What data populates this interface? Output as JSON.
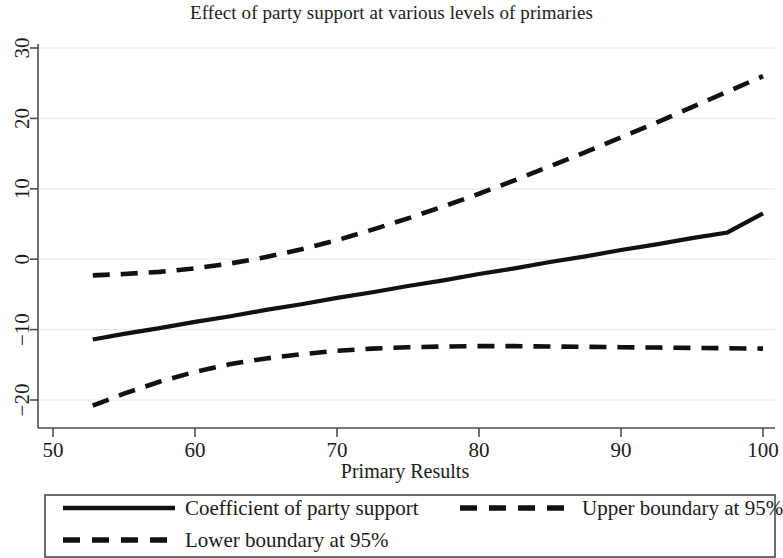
{
  "figure": {
    "title": "Effect of party support at various levels of primaries",
    "background": "#ffffff",
    "line_color": "#111111",
    "grid_color": "#e8e8e8",
    "axis_color": "#4d4d4d"
  },
  "axes": {
    "x": {
      "label": "Primary Results",
      "ticks": [
        "50",
        "60",
        "70",
        "80",
        "90",
        "100"
      ],
      "tick_values": [
        50,
        60,
        70,
        80,
        90,
        100
      ],
      "min": 50,
      "max": 100
    },
    "y": {
      "label": "",
      "ticks": [
        "30",
        "20",
        "10",
        "0",
        "-10",
        "-20"
      ],
      "tick_values": [
        30,
        20,
        10,
        0,
        -10,
        -20
      ],
      "min": -22,
      "max": 32
    }
  },
  "legend": {
    "entries": [
      {
        "label": "Coefficient of party support",
        "style": "solid"
      },
      {
        "label": "Upper boundary at 95%",
        "style": "dashed"
      },
      {
        "label": "Lower boundary at 95%",
        "style": "dashed"
      }
    ]
  },
  "chart_data": {
    "type": "line",
    "title": "Effect of party support at various levels of primaries",
    "xlabel": "Primary Results",
    "ylabel": "",
    "xlim": [
      50,
      100
    ],
    "ylim": [
      -22,
      32
    ],
    "grid": true,
    "legend_position": "below-axes",
    "x": [
      52.8,
      55,
      57.5,
      60,
      62.5,
      65,
      67.5,
      70,
      72.5,
      75,
      77.5,
      80,
      82.5,
      85,
      87.5,
      90,
      92.5,
      95,
      97.5,
      100
    ],
    "series": [
      {
        "name": "Coefficient of party support",
        "style": "solid",
        "values": [
          -11.4,
          -10.6,
          -9.8,
          -8.9,
          -8.1,
          -7.2,
          -6.4,
          -5.5,
          -4.7,
          -3.8,
          -3.0,
          -2.1,
          -1.3,
          -0.4,
          0.4,
          1.3,
          2.1,
          3.0,
          3.8,
          6.5
        ]
      },
      {
        "name": "Upper boundary at 95%",
        "style": "dashed",
        "values": [
          -2.3,
          -2.1,
          -1.8,
          -1.3,
          -0.6,
          0.3,
          1.4,
          2.7,
          4.2,
          5.8,
          7.5,
          9.3,
          11.2,
          13.2,
          15.2,
          17.3,
          19.4,
          21.6,
          23.8,
          26.0
        ]
      },
      {
        "name": "Lower boundary at 95%",
        "style": "dashed",
        "values": [
          -20.8,
          -19.1,
          -17.4,
          -16.0,
          -14.9,
          -14.1,
          -13.5,
          -13.0,
          -12.7,
          -12.5,
          -12.4,
          -12.35,
          -12.35,
          -12.4,
          -12.45,
          -12.5,
          -12.55,
          -12.6,
          -12.65,
          -12.7
        ]
      }
    ]
  }
}
